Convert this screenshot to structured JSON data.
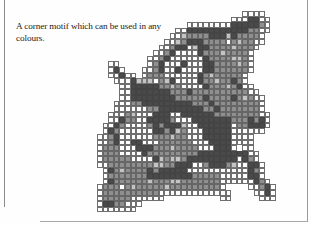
{
  "caption": "A corner motif which can be used in any colours.",
  "chart_data": {
    "type": "table",
    "legend": {
      "o": "empty square",
      "l": "light shade",
      "m": "medium shade",
      "d": "dark shade",
      ".": "no square"
    },
    "colors": {
      "empty": "#ffffff",
      "light": "#c4c4c4",
      "medium": "#8f8f8f",
      "dark": "#4a4a4a",
      "grid": "#6f6f6f"
    },
    "rows": [
      "..........................oooo...",
      "........................oooddoo..",
      "................oooooooodddddmo..",
      "..............oodddddddddddmmoo..",
      ".............oolmmmmdddldmmmmo...",
      "............oolmdddmmmmomlmmoo...",
      "...........oomddolddmmmmlmmmo....",
      "..........oomdoooodmmmlmmmmo.....",
      ".........oomdoooooodmmmmllmo.....",
      "..oo.....omdooodoooddmmmmlmo.....",
      "..odo...oomdoodooooddmmmmmmo.....",
      "..oodoo.ommmoooooodmlmmmmmo......",
      "...ooodlllomldoooodmmlmmdmo......",
      "....oodddddmmlmoooodmmmlmdoo.....",
      "....oodddddddmmmdmmmmmmmmmmoo....",
      "....ooddddddddmmmmmdmmmmdmlmoo...",
      "...ooommdddddddddmmmdmmmmmmmmo...",
      "...oooooommddddddddmmdmmmmmmmo...",
      "..ooomlooodddooddddddmmmmmmmmoo..",
      "..oodmmooddddmooodddddddmmmdmdo..",
      ".oodmoooomdmdddlooddddddommdddo..",
      ".odmooooooddmdlmooodddddoooooo...",
      "oomdoooooommmlmmooodddddoooo.....",
      "oomdooddooommmmmmoooddddoooo.....",
      "ommmooodddmmmlmmmmooodddo.oo.....",
      "ommmoooodmmmmmmmmmdddddddddoo....",
      "ommmmmoooodlmllmdddddddddodmo....",
      "oommmmmmmmllmmdddoomdddmlooddo...",
      ".odmlmmmmdmdddddooooooooooodmo...",
      ".ommmmmmmddddddddmmmmmoooooddo...",
      ".odmmmmmmlmmmllmmmmmmmoooooodmo..",
      "ommmomlmmmmmlmmmmmmmmmo....oomdo.",
      "ommmmmmmmmmooooooooooooo....oodo.",
      "ommmmmoooooo..........oo.....ooo.",
      "oddmmooo...........................",
      "ooooooo.........................."
    ]
  }
}
